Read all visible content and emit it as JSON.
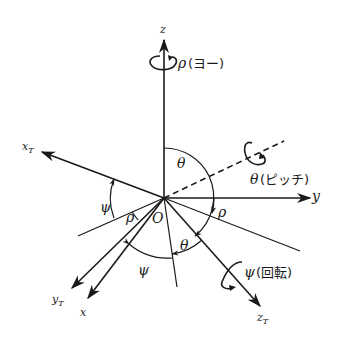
{
  "diagram": {
    "origin_label": "O",
    "axes": {
      "z": {
        "label": "z"
      },
      "y": {
        "label": "y"
      },
      "x": {
        "label": "x"
      },
      "x_T": {
        "label": "x",
        "sub": "T"
      },
      "y_T": {
        "label": "y",
        "sub": "T"
      },
      "z_T": {
        "label": "z",
        "sub": "T"
      }
    },
    "rotations": {
      "yaw": {
        "symbol": "ρ",
        "text": "(ヨー)"
      },
      "pitch": {
        "symbol": "θ",
        "text": "(ピッチ)"
      },
      "roll": {
        "symbol": "ψ",
        "text": "(回転)"
      }
    },
    "angles": {
      "theta_top": "θ",
      "psi_left": "ψ",
      "rho_left": "ρ",
      "rho_right": "ρ",
      "theta_lower": "θ",
      "psi_lower": "ψ"
    },
    "colors": {
      "ink": "#1a1a1a",
      "background": "#ffffff"
    }
  }
}
